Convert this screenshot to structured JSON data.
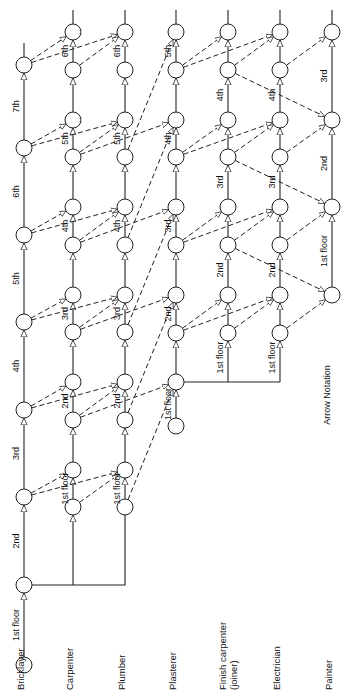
{
  "title": "Arrow Notation",
  "trades": [
    {
      "name": "Bricklayer",
      "x": 24,
      "lines": [
        "Bricklayer"
      ]
    },
    {
      "name": "Carpenter",
      "x": 73,
      "lines": [
        "Carpenter"
      ]
    },
    {
      "name": "Plumber",
      "x": 125,
      "lines": [
        "Plumber"
      ]
    },
    {
      "name": "Plasterer",
      "x": 176,
      "lines": [
        "Plasterer"
      ]
    },
    {
      "name": "Finish carpenter (joiner)",
      "x": 228,
      "lines": [
        "Finish carpenter",
        "(joiner)"
      ]
    },
    {
      "name": "Electrician",
      "x": 280,
      "lines": [
        "Electrician"
      ]
    },
    {
      "name": "Painter",
      "x": 332,
      "lines": [
        "Painter"
      ]
    }
  ],
  "activities": {
    "bricklayer": [
      "1st floor",
      "2nd",
      "3rd",
      "4th",
      "5th",
      "6th",
      "7th"
    ],
    "carpenter": [
      "1st floor",
      "2nd",
      "3rd",
      "4th",
      "5th",
      "6th"
    ],
    "plumber": [
      "1st floor",
      "2nd",
      "3rd",
      "4th",
      "5th",
      "6th"
    ],
    "plasterer": [
      "1st floor",
      "2nd",
      "3rd",
      "4th",
      "5th"
    ],
    "finish_carpenter": [
      "1st floor",
      "2nd",
      "3rd",
      "4th"
    ],
    "electrician": [
      "1st floor",
      "2nd",
      "3rd",
      "4th"
    ],
    "painter": [
      "1st floor",
      "2nd",
      "3rd"
    ]
  },
  "layout": {
    "bricklayer_nodes_y": [
      665,
      585,
      497,
      410,
      322,
      235,
      148,
      65
    ],
    "group_a_nodes_y": [
      507,
      470,
      420,
      382,
      332,
      295,
      245,
      207,
      157,
      120,
      70,
      32
    ],
    "group_b_nodes_y": [
      426,
      382,
      333,
      295,
      245,
      207,
      157,
      120,
      70,
      32
    ],
    "painter_nodes_y": [
      295,
      207,
      120,
      32
    ]
  }
}
